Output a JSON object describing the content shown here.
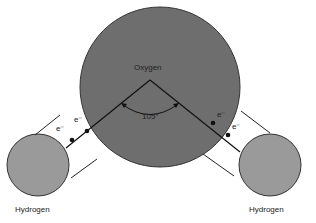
{
  "diagram": {
    "oxygen": {
      "label": "Oxygen",
      "color": "#6e6e6e"
    },
    "hydrogen_left": {
      "label": "Hydrogen",
      "color": "#9a9a9a"
    },
    "hydrogen_right": {
      "label": "Hydrogen",
      "color": "#9a9a9a"
    },
    "angle": {
      "label": "105°"
    },
    "electrons": [
      {
        "label": "e⁻"
      },
      {
        "label": "e⁻"
      },
      {
        "label": "e⁻"
      },
      {
        "label": "e⁻"
      }
    ]
  }
}
